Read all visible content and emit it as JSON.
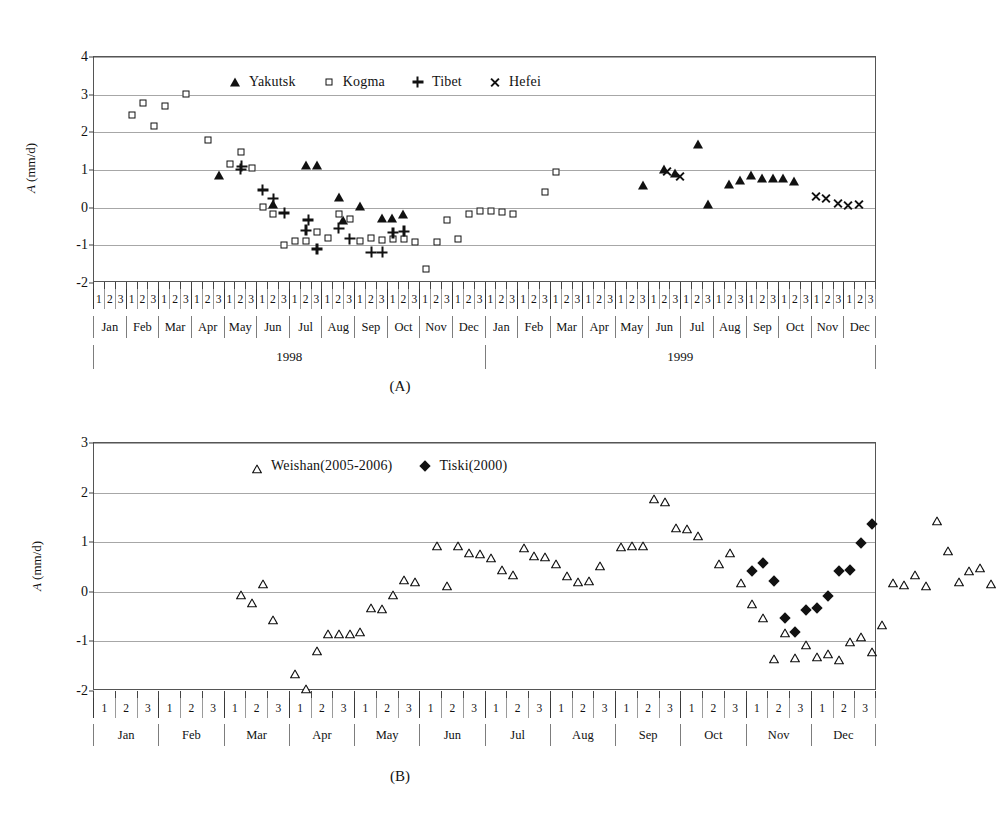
{
  "figure": {
    "panels": [
      {
        "caption": "(A)",
        "ylabel_prefix": "A",
        "ylabel_suffix": " (mm/d)",
        "legend": [
          {
            "label": "Yakutsk",
            "marker": "filled-triangle"
          },
          {
            "label": "Kogma",
            "marker": "open-square"
          },
          {
            "label": "Tibet",
            "marker": "plus"
          },
          {
            "label": "Hefei",
            "marker": "cross"
          }
        ]
      },
      {
        "caption": "(B)",
        "ylabel_prefix": "A",
        "ylabel_suffix": " (mm/d)",
        "legend": [
          {
            "label": "Weishan(2005-2006)",
            "marker": "open-triangle"
          },
          {
            "label": "Tiski(2000)",
            "marker": "filled-diamond"
          }
        ]
      }
    ],
    "months": [
      "Jan",
      "Feb",
      "Mar",
      "Apr",
      "May",
      "Jun",
      "Jul",
      "Aug",
      "Sep",
      "Oct",
      "Nov",
      "Dec"
    ],
    "decads": [
      "1",
      "2",
      "3"
    ]
  },
  "chart_data": [
    {
      "type": "scatter",
      "panel": "(A)",
      "title": "",
      "xlabel": "",
      "ylabel": "A (mm/d)",
      "ylim": [
        -2,
        4
      ],
      "yticks": [
        -2,
        -1,
        0,
        1,
        2,
        3,
        4
      ],
      "grid": true,
      "legend_position": "top-center",
      "x_axis": {
        "type": "decadal",
        "years": [
          "1998",
          "1999"
        ],
        "months": [
          "Jan",
          "Feb",
          "Mar",
          "Apr",
          "May",
          "Jun",
          "Jul",
          "Aug",
          "Sep",
          "Oct",
          "Nov",
          "Dec"
        ],
        "decads_per_month": 3,
        "total_points": 72,
        "xlim": [
          0,
          72
        ]
      },
      "series": [
        {
          "name": "Yakutsk",
          "marker": "filled-triangle",
          "points": [
            {
              "x": 11.5,
              "y": 0.87
            },
            {
              "x": 16.5,
              "y": 0.1
            },
            {
              "x": 19.5,
              "y": 1.13
            },
            {
              "x": 20.5,
              "y": 1.13
            },
            {
              "x": 22.5,
              "y": 0.27
            },
            {
              "x": 22.9,
              "y": -0.32
            },
            {
              "x": 24.5,
              "y": 0.05
            },
            {
              "x": 26.5,
              "y": -0.28
            },
            {
              "x": 27.4,
              "y": -0.27
            },
            {
              "x": 28.4,
              "y": -0.18
            },
            {
              "x": 50.5,
              "y": 0.59
            },
            {
              "x": 52.4,
              "y": 1.02
            },
            {
              "x": 53.4,
              "y": 0.92
            },
            {
              "x": 55.5,
              "y": 1.7
            },
            {
              "x": 56.5,
              "y": 0.1
            },
            {
              "x": 58.4,
              "y": 0.62
            },
            {
              "x": 59.4,
              "y": 0.73
            },
            {
              "x": 60.4,
              "y": 0.88
            },
            {
              "x": 61.4,
              "y": 0.8
            },
            {
              "x": 62.4,
              "y": 0.78
            },
            {
              "x": 63.4,
              "y": 0.78
            },
            {
              "x": 64.4,
              "y": 0.7
            }
          ]
        },
        {
          "name": "Kogma",
          "marker": "open-square",
          "points": [
            {
              "x": 3.5,
              "y": 2.45
            },
            {
              "x": 4.5,
              "y": 2.78
            },
            {
              "x": 5.5,
              "y": 2.17
            },
            {
              "x": 6.5,
              "y": 2.7
            },
            {
              "x": 8.5,
              "y": 3.02
            },
            {
              "x": 10.5,
              "y": 1.8
            },
            {
              "x": 12.5,
              "y": 1.17
            },
            {
              "x": 13.5,
              "y": 1.47
            },
            {
              "x": 14.5,
              "y": 1.05
            },
            {
              "x": 15.5,
              "y": 0.03
            },
            {
              "x": 16.5,
              "y": -0.17
            },
            {
              "x": 17.5,
              "y": -1.0
            },
            {
              "x": 18.5,
              "y": -0.88
            },
            {
              "x": 19.5,
              "y": -0.88
            },
            {
              "x": 20.5,
              "y": -0.65
            },
            {
              "x": 21.5,
              "y": -0.8
            },
            {
              "x": 22.5,
              "y": -0.17
            },
            {
              "x": 23.5,
              "y": -0.31
            },
            {
              "x": 24.5,
              "y": -0.88
            },
            {
              "x": 25.5,
              "y": -0.8
            },
            {
              "x": 26.5,
              "y": -0.87
            },
            {
              "x": 27.5,
              "y": -0.84
            },
            {
              "x": 28.5,
              "y": -0.82
            },
            {
              "x": 29.5,
              "y": -0.92
            },
            {
              "x": 30.5,
              "y": -1.62
            },
            {
              "x": 31.5,
              "y": -0.92
            },
            {
              "x": 32.5,
              "y": -0.32
            },
            {
              "x": 33.5,
              "y": -0.82
            },
            {
              "x": 34.5,
              "y": -0.17
            },
            {
              "x": 35.5,
              "y": -0.08
            },
            {
              "x": 36.5,
              "y": -0.08
            },
            {
              "x": 37.5,
              "y": -0.12
            },
            {
              "x": 38.5,
              "y": -0.17
            },
            {
              "x": 41.5,
              "y": 0.42
            },
            {
              "x": 42.5,
              "y": 0.94
            }
          ]
        },
        {
          "name": "Tibet",
          "marker": "plus",
          "points": [
            {
              "x": 13.5,
              "y": 1.02
            },
            {
              "x": 13.6,
              "y": 1.1
            },
            {
              "x": 15.5,
              "y": 0.47
            },
            {
              "x": 16.5,
              "y": 0.24
            },
            {
              "x": 17.5,
              "y": -0.14
            },
            {
              "x": 19.5,
              "y": -0.6
            },
            {
              "x": 19.7,
              "y": -0.33
            },
            {
              "x": 20.5,
              "y": -1.1
            },
            {
              "x": 22.5,
              "y": -0.55
            },
            {
              "x": 23.5,
              "y": -0.82
            },
            {
              "x": 25.5,
              "y": -1.18
            },
            {
              "x": 26.5,
              "y": -1.18
            },
            {
              "x": 27.5,
              "y": -0.66
            },
            {
              "x": 28.5,
              "y": -0.63
            }
          ]
        },
        {
          "name": "Hefei",
          "marker": "cross",
          "points": [
            {
              "x": 52.7,
              "y": 0.97
            },
            {
              "x": 53.9,
              "y": 0.84
            },
            {
              "x": 66.4,
              "y": 0.3
            },
            {
              "x": 67.3,
              "y": 0.24
            },
            {
              "x": 68.4,
              "y": 0.1
            },
            {
              "x": 69.3,
              "y": 0.07
            },
            {
              "x": 70.3,
              "y": 0.08
            }
          ]
        }
      ]
    },
    {
      "type": "scatter",
      "panel": "(B)",
      "title": "",
      "xlabel": "",
      "ylabel": "A (mm/d)",
      "ylim": [
        -2,
        3
      ],
      "yticks": [
        -2,
        -1,
        0,
        1,
        2,
        3
      ],
      "grid": true,
      "legend_position": "top-center",
      "x_axis": {
        "type": "decadal",
        "years": [],
        "months": [
          "Jan",
          "Feb",
          "Mar",
          "Apr",
          "May",
          "Jun",
          "Jul",
          "Aug",
          "Sep",
          "Oct",
          "Nov",
          "Dec"
        ],
        "decads_per_month": 3,
        "total_points": 72,
        "xlim": [
          0,
          72
        ]
      },
      "series": [
        {
          "name": "Weishan(2005-2006)",
          "marker": "open-triangle",
          "points": [
            {
              "x": 13.5,
              "y": 0.03
            },
            {
              "x": 14.5,
              "y": -0.13
            },
            {
              "x": 15.5,
              "y": 0.26
            },
            {
              "x": 16.5,
              "y": -0.47
            },
            {
              "x": 18.5,
              "y": -1.55
            },
            {
              "x": 19.5,
              "y": -1.85
            },
            {
              "x": 20.5,
              "y": -1.1
            },
            {
              "x": 21.5,
              "y": -0.75
            },
            {
              "x": 22.5,
              "y": -0.75
            },
            {
              "x": 23.5,
              "y": -0.75
            },
            {
              "x": 24.5,
              "y": -0.7
            },
            {
              "x": 25.5,
              "y": -0.22
            },
            {
              "x": 26.5,
              "y": -0.25
            },
            {
              "x": 27.5,
              "y": 0.04
            },
            {
              "x": 28.5,
              "y": 0.33
            },
            {
              "x": 29.5,
              "y": 0.3
            },
            {
              "x": 31.5,
              "y": 1.02
            },
            {
              "x": 32.5,
              "y": 0.22
            },
            {
              "x": 33.5,
              "y": 1.02
            },
            {
              "x": 34.5,
              "y": 0.88
            },
            {
              "x": 35.5,
              "y": 0.86
            },
            {
              "x": 36.5,
              "y": 0.79
            },
            {
              "x": 37.5,
              "y": 0.54
            },
            {
              "x": 38.5,
              "y": 0.44
            },
            {
              "x": 39.5,
              "y": 0.98
            },
            {
              "x": 40.5,
              "y": 0.82
            },
            {
              "x": 41.5,
              "y": 0.8
            },
            {
              "x": 42.5,
              "y": 0.66
            },
            {
              "x": 43.5,
              "y": 0.42
            },
            {
              "x": 44.5,
              "y": 0.3
            },
            {
              "x": 45.5,
              "y": 0.32
            },
            {
              "x": 46.5,
              "y": 0.62
            },
            {
              "x": 48.5,
              "y": 1.01
            },
            {
              "x": 49.5,
              "y": 1.03
            },
            {
              "x": 50.5,
              "y": 1.02
            },
            {
              "x": 51.5,
              "y": 1.98
            },
            {
              "x": 52.5,
              "y": 1.92
            },
            {
              "x": 53.5,
              "y": 1.38
            },
            {
              "x": 54.5,
              "y": 1.36
            },
            {
              "x": 55.5,
              "y": 1.23
            },
            {
              "x": 57.5,
              "y": 0.66
            },
            {
              "x": 58.5,
              "y": 0.88
            },
            {
              "x": 59.5,
              "y": 0.28
            },
            {
              "x": 60.5,
              "y": -0.14
            },
            {
              "x": 61.5,
              "y": -0.43
            },
            {
              "x": 62.5,
              "y": -1.26
            },
            {
              "x": 63.5,
              "y": -0.72
            },
            {
              "x": 64.5,
              "y": -1.23
            },
            {
              "x": 65.5,
              "y": -0.98
            },
            {
              "x": 66.5,
              "y": -1.22
            },
            {
              "x": 67.5,
              "y": -1.15
            },
            {
              "x": 68.5,
              "y": -1.28
            },
            {
              "x": 69.5,
              "y": -0.92
            },
            {
              "x": 70.5,
              "y": -0.82
            },
            {
              "x": 71.5,
              "y": -1.12
            },
            {
              "x": 72.5,
              "y": -0.57
            },
            {
              "x": 73.5,
              "y": 0.28
            },
            {
              "x": 74.5,
              "y": 0.24
            },
            {
              "x": 75.5,
              "y": 0.44
            },
            {
              "x": 76.5,
              "y": 0.22
            },
            {
              "x": 77.5,
              "y": 1.52
            },
            {
              "x": 78.5,
              "y": 0.92
            },
            {
              "x": 79.5,
              "y": 0.3
            },
            {
              "x": 80.5,
              "y": 0.52
            },
            {
              "x": 81.5,
              "y": 0.58
            },
            {
              "x": 82.5,
              "y": 0.26
            }
          ]
        },
        {
          "name": "Tiski(2000)",
          "marker": "filled-diamond",
          "points": [
            {
              "x": 60.5,
              "y": 0.42
            },
            {
              "x": 61.5,
              "y": 0.58
            },
            {
              "x": 62.5,
              "y": 0.22
            },
            {
              "x": 63.5,
              "y": -0.52
            },
            {
              "x": 64.5,
              "y": -0.82
            },
            {
              "x": 65.5,
              "y": -0.36
            },
            {
              "x": 66.5,
              "y": -0.32
            },
            {
              "x": 67.5,
              "y": -0.08
            },
            {
              "x": 68.5,
              "y": 0.41
            },
            {
              "x": 69.5,
              "y": 0.44
            },
            {
              "x": 70.5,
              "y": 0.98
            },
            {
              "x": 71.5,
              "y": 1.36
            }
          ]
        }
      ]
    }
  ]
}
